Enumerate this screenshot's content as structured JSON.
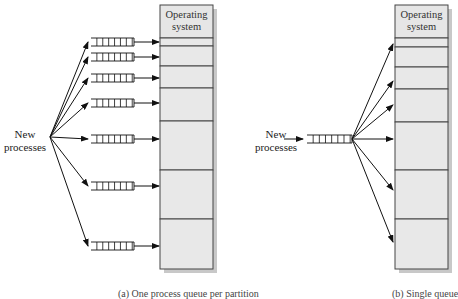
{
  "figure": {
    "left_panel": {
      "os_label": [
        "Operating",
        "system"
      ],
      "source_label": [
        "New",
        "processes"
      ],
      "caption": "(a) One process queue per partition",
      "partition_boundaries_y": [
        5,
        38,
        46,
        66,
        88,
        121,
        170,
        219,
        269
      ],
      "queues_y": [
        42,
        57,
        78,
        103,
        139,
        186,
        246
      ]
    },
    "right_panel": {
      "os_label": [
        "Operating",
        "system"
      ],
      "source_label": [
        "New",
        "processes"
      ],
      "caption": "(b) Single queue",
      "partition_boundaries_y": [
        5,
        38,
        47,
        67,
        89,
        122,
        170,
        219,
        269
      ],
      "targets_y": [
        44,
        81,
        105,
        139,
        190,
        242
      ]
    },
    "colors": {
      "partition_fill": "#e8e8e8",
      "os_fill": "#e6e6e6",
      "border": "#444444",
      "shadow": "#c8c8c8",
      "line": "#111111"
    }
  }
}
